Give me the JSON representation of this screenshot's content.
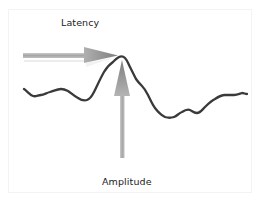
{
  "diagram": {
    "labels": {
      "latency": "Latency",
      "amplitude": "Amplitude"
    },
    "colors": {
      "waveform": "#3a3a3a",
      "arrow": "#9a9a9a",
      "arrow_head": "#8c8c8c",
      "text": "#222222",
      "background": "#ffffff"
    },
    "elements": [
      {
        "type": "waveform",
        "description": "Noisy evoked-potential trace with a single prominent peak"
      },
      {
        "type": "arrow",
        "direction": "right",
        "label": "Latency",
        "description": "Horizontal arrow pointing to the peak"
      },
      {
        "type": "arrow",
        "direction": "up",
        "label": "Amplitude",
        "description": "Vertical arrow pointing up to the peak"
      }
    ]
  }
}
